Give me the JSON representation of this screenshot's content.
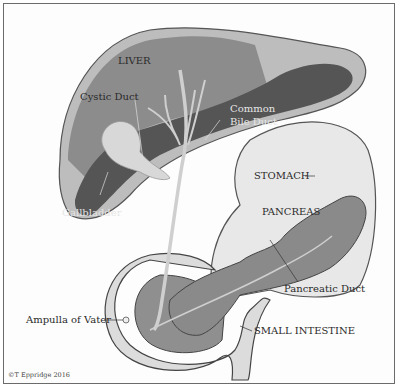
{
  "figure": {
    "labels": {
      "liver": "LIVER",
      "cystic_duct": "Cystic Duct",
      "common_bile_duct_line1": "Common",
      "common_bile_duct_line2": "Bile Duct",
      "gallbladder": "Gallbladder",
      "stomach": "STOMACH",
      "pancreas": "PANCREAS",
      "pancreatic_duct": "Pancreatic Duct",
      "ampulla": "Ampulla of Vater",
      "small_intestine": "SMALL INTESTINE"
    },
    "credit": "©T Eppridge 2016",
    "colors": {
      "liver_light": "#8c8c8c",
      "liver_dark": "#555555",
      "liver_rim": "#bdbdbd",
      "stomach": "#e8e8e8",
      "pancreas": "#8a8a8a",
      "duct": "#cfcfcf",
      "intestine": "#dcdcdc",
      "outline": "#444444"
    }
  }
}
